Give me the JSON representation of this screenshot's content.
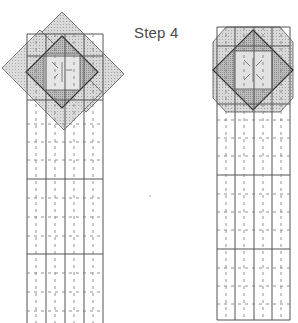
{
  "title": "Step 4",
  "colors": {
    "grid_line": "#555555",
    "dash_line": "#666666",
    "light_fill": "#d6d6d6",
    "mid_fill": "#bdbdbd",
    "dark_fill": "#a9a9a9",
    "outline": "#444444"
  },
  "figures": [
    {
      "id": "left-strip",
      "description": "Long vertical strip of 4 columns with diagonal tilted squares overlaid at the top",
      "columns": 4,
      "grid": {
        "x": 27,
        "y": 34,
        "width": 76,
        "height": 292
      },
      "section_lines_y": [
        86,
        178,
        254
      ],
      "overlay": {
        "type": "tilted-squares",
        "center": [
          62,
          72
        ]
      }
    },
    {
      "id": "right-strip",
      "description": "Long vertical strip of 4 columns with octagon and diamond overlaid at the top",
      "columns": 4,
      "grid": {
        "x": 217,
        "y": 27,
        "width": 73,
        "height": 293
      },
      "section_lines_y": [
        110,
        176,
        249
      ],
      "overlay": {
        "type": "octagon-diamond",
        "center": [
          253,
          70
        ]
      }
    }
  ]
}
